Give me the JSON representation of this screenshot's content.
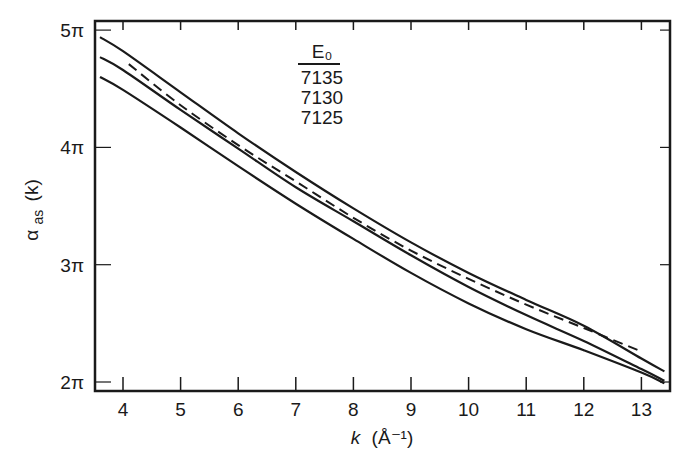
{
  "chart_data": {
    "type": "line",
    "title": "",
    "xlabel": "k (Å⁻¹)",
    "ylabel": "α_as(k)",
    "xlim": [
      3.6,
      13.4
    ],
    "ylim": [
      1.95,
      5.05
    ],
    "y_units": "π",
    "x_ticks": [
      4,
      5,
      6,
      7,
      8,
      9,
      10,
      11,
      12,
      13
    ],
    "x_tick_labels": [
      "4",
      "5",
      "6",
      "7",
      "8",
      "9",
      "10",
      "11",
      "12",
      "13"
    ],
    "y_ticks": [
      2,
      3,
      4,
      5
    ],
    "y_tick_labels": [
      "2π",
      "3π",
      "4π",
      "5π"
    ],
    "grid": false,
    "legend": {
      "title": "E₀",
      "position": "upper-center",
      "entries": [
        "7135",
        "7130",
        "7125"
      ]
    },
    "series": [
      {
        "name": "7135",
        "style": "solid",
        "x": [
          3.6,
          4,
          5,
          6,
          7,
          8,
          9,
          10,
          11,
          12,
          13,
          13.4
        ],
        "y": [
          4.94,
          4.82,
          4.47,
          4.12,
          3.79,
          3.48,
          3.19,
          2.93,
          2.7,
          2.48,
          2.2,
          2.09
        ]
      },
      {
        "name": "7130",
        "style": "solid",
        "x": [
          3.6,
          4,
          5,
          6,
          7,
          8,
          9,
          10,
          11,
          12,
          13,
          13.4
        ],
        "y": [
          4.77,
          4.66,
          4.32,
          3.99,
          3.66,
          3.37,
          3.08,
          2.81,
          2.57,
          2.35,
          2.11,
          2.01
        ]
      },
      {
        "name": "7125",
        "style": "solid",
        "x": [
          3.6,
          4,
          5,
          6,
          7,
          8,
          9,
          10,
          11,
          12,
          13,
          13.4
        ],
        "y": [
          4.6,
          4.49,
          4.17,
          3.84,
          3.52,
          3.22,
          2.93,
          2.67,
          2.45,
          2.27,
          2.08,
          1.99
        ]
      },
      {
        "name": "reference (dashed)",
        "style": "dashed",
        "x": [
          4.1,
          5,
          6,
          7,
          8,
          9,
          10,
          11,
          12,
          13
        ],
        "y": [
          4.71,
          4.36,
          4.02,
          3.71,
          3.4,
          3.12,
          2.88,
          2.66,
          2.46,
          2.26
        ]
      }
    ]
  },
  "labels": {
    "legend_title": "E₀",
    "xlabel_k": "k",
    "xlabel_units": "(Å⁻¹)",
    "ylabel_main": "α",
    "ylabel_sub": "as",
    "ylabel_arg": "(k)"
  }
}
